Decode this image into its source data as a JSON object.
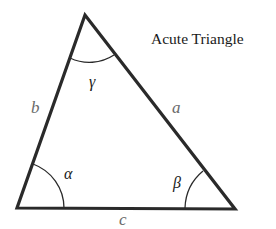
{
  "diagram": {
    "title": "Acute Triangle",
    "vertices": {
      "top": {
        "x": 85,
        "y": 15
      },
      "bottom_left": {
        "x": 17,
        "y": 208
      },
      "bottom_right": {
        "x": 235,
        "y": 209
      }
    },
    "sides": {
      "a": {
        "label": "a",
        "between": [
          "top",
          "bottom_right"
        ]
      },
      "b": {
        "label": "b",
        "between": [
          "top",
          "bottom_left"
        ]
      },
      "c": {
        "label": "c",
        "between": [
          "bottom_left",
          "bottom_right"
        ]
      }
    },
    "angles": {
      "alpha": {
        "label": "α",
        "vertex": "bottom_left"
      },
      "beta": {
        "label": "β",
        "vertex": "bottom_right"
      },
      "gamma": {
        "label": "γ",
        "vertex": "top"
      }
    },
    "colors": {
      "stroke": "#2a2a2a",
      "side_label": "#6a6a6a",
      "angle_label": "#1a1a1a",
      "background": "#ffffff"
    }
  }
}
